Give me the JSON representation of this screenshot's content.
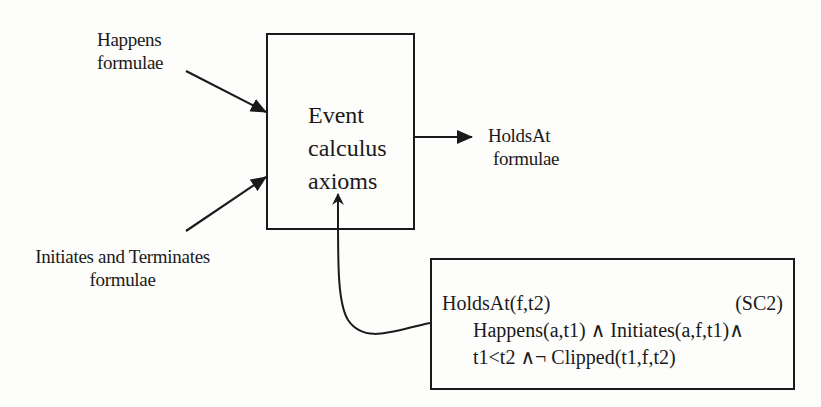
{
  "diagram": {
    "inputs": [
      {
        "id": "happens",
        "lines": [
          "Happens",
          "formulae"
        ]
      },
      {
        "id": "initiates_terminates",
        "lines": [
          "Initiates and Terminates",
          "formulae"
        ]
      }
    ],
    "process": {
      "lines": [
        "Event",
        "calculus",
        "axioms"
      ]
    },
    "output": {
      "lines": [
        "HoldsAt",
        "formulae"
      ]
    },
    "axiom": {
      "head": "HoldsAt(f,t2)",
      "tag": "(SC2)",
      "body": [
        "Happens(a,t1) ∧ Initiates(a,f,t1)∧",
        "t1<t2 ∧¬ Clipped(t1,f,t2)"
      ]
    },
    "edges": [
      {
        "from": "Happens formulae",
        "to": "Event calculus axioms"
      },
      {
        "from": "Initiates and Terminates formulae",
        "to": "Event calculus axioms"
      },
      {
        "from": "Event calculus axioms",
        "to": "HoldsAt formulae"
      },
      {
        "from": "SC2 axiom",
        "to": "Event calculus axioms"
      }
    ],
    "colors": {
      "ink": "#1a1a1a",
      "background": "#fdfdfb"
    }
  }
}
